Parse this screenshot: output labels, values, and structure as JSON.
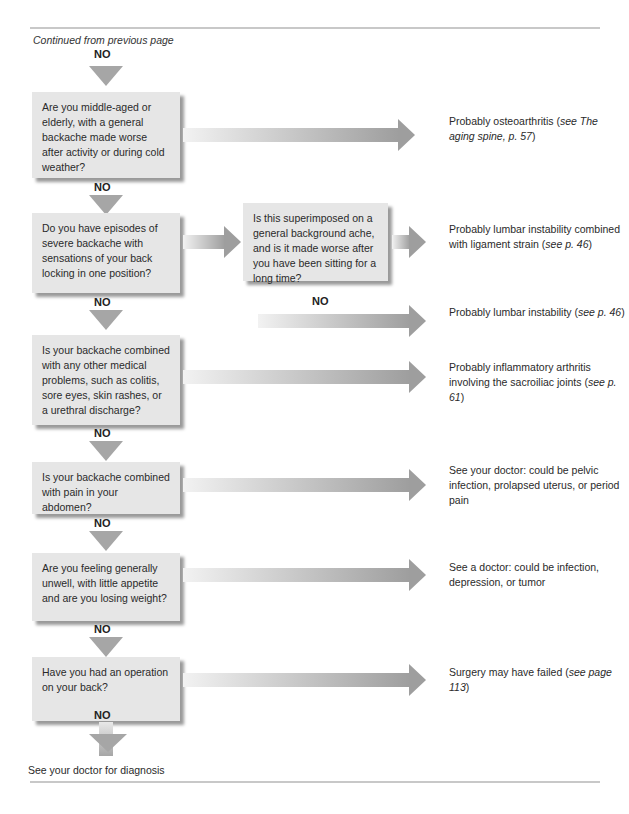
{
  "header": {
    "continued": "Continued from previous page"
  },
  "labels": {
    "yes": "YES",
    "no": "NO"
  },
  "questions": [
    "Are you middle-aged or elderly, with a general backache made worse after activity or during cold weather?",
    "Do you have episodes of severe backache with sensations of your back locking in one position?",
    "Is this superimposed on a general background ache, and is it made worse after you have been sitting for a long time?",
    "Is your backache combined with any other medical problems, such as colitis, sore eyes, skin rashes, or a urethral discharge?",
    "Is your backache combined with pain in your abdomen?",
    "Are you feeling generally unwell, with little appetite and are you losing weight?",
    "Have you had an operation on your back?"
  ],
  "outcomes": [
    {
      "text": "Probably osteoarthritis (",
      "ref": "see The aging spine, p. 57",
      "end": ")"
    },
    {
      "text": "Probably lumbar instability combined with ligament strain (",
      "ref": "see p. 46",
      "end": ")"
    },
    {
      "text": "Probably lumbar instability (",
      "ref": "see p. 46",
      "end": ")"
    },
    {
      "text": "Probably inflammatory arthritis involving the sacroiliac joints (",
      "ref": "see p. 61",
      "end": ")"
    },
    {
      "text": "See your doctor: could be pelvic infection, prolapsed uterus, or period pain",
      "ref": "",
      "end": ""
    },
    {
      "text": "See a doctor: could be infection, depression, or tumor",
      "ref": "",
      "end": ""
    },
    {
      "text": "Surgery may have failed (",
      "ref": "see page 113",
      "end": ")"
    }
  ],
  "final": "See your doctor for diagnosis",
  "colors": {
    "box": "#e6e6e6",
    "arrow": "#9e9e9e",
    "rule": "#c8c8c8"
  }
}
